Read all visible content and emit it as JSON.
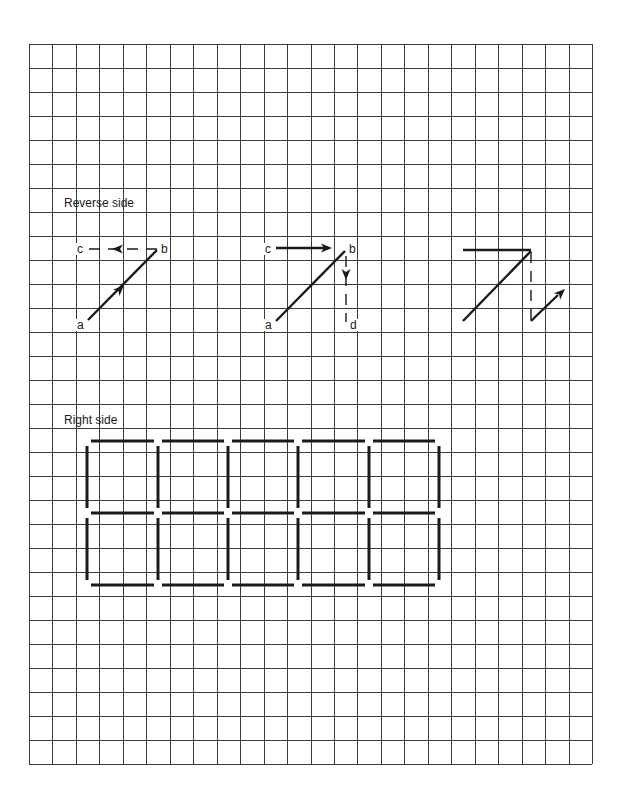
{
  "page": {
    "width": 623,
    "height": 799,
    "background": "#ffffff",
    "ink": "#1a1a1a"
  },
  "grid": {
    "x0": 29,
    "y0": 44,
    "x1": 592,
    "y1": 764,
    "columns": 24,
    "rows": 30,
    "line_color": "#3a3a3a"
  },
  "sections": {
    "reverse": {
      "label": "Reverse side",
      "label_pos": [
        64,
        207
      ]
    },
    "right": {
      "label": "Right side",
      "label_pos": [
        64,
        424
      ]
    }
  },
  "figures": [
    {
      "id": "figure-1",
      "points": {
        "a": [
          88,
          320
        ],
        "b": [
          157,
          250
        ],
        "c": [
          88,
          249
        ]
      },
      "labels": [
        {
          "text": "a",
          "x": 77,
          "y": 329
        },
        {
          "text": "b",
          "x": 161,
          "y": 253
        },
        {
          "text": "c",
          "x": 77,
          "y": 253
        }
      ],
      "solid_lines": [
        {
          "from": [
            88,
            320
          ],
          "to": [
            157,
            250
          ]
        }
      ],
      "dashed_lines": [
        {
          "from": [
            157,
            249
          ],
          "to": [
            88,
            249
          ]
        }
      ],
      "arrowheads": [
        {
          "at": [
            124,
            285
          ],
          "direction": [
            1,
            -1.01
          ]
        },
        {
          "at": [
            112,
            249
          ],
          "direction": [
            -1,
            0
          ]
        }
      ]
    },
    {
      "id": "figure-2",
      "points": {
        "a": [
          276,
          321
        ],
        "b": [
          345,
          251
        ],
        "c": [
          276,
          248
        ],
        "d": [
          346,
          322
        ]
      },
      "labels": [
        {
          "text": "a",
          "x": 265,
          "y": 329
        },
        {
          "text": "b",
          "x": 349,
          "y": 253
        },
        {
          "text": "c",
          "x": 265,
          "y": 253
        },
        {
          "text": "d",
          "x": 350,
          "y": 329
        }
      ],
      "solid_lines": [
        {
          "from": [
            276,
            321
          ],
          "to": [
            345,
            251
          ]
        },
        {
          "from": [
            276,
            248
          ],
          "to": [
            324,
            248
          ]
        }
      ],
      "dashed_lines": [
        {
          "from": [
            346,
            256
          ],
          "to": [
            346,
            322
          ]
        }
      ],
      "arrowheads": [
        {
          "at": [
            332,
            248
          ],
          "direction": [
            1,
            0
          ]
        },
        {
          "at": [
            346,
            280
          ],
          "direction": [
            0,
            1
          ]
        }
      ]
    },
    {
      "id": "figure-3",
      "points": {},
      "labels": [],
      "solid_lines": [
        {
          "from": [
            463,
            250
          ],
          "to": [
            531,
            250
          ]
        },
        {
          "from": [
            463,
            321
          ],
          "to": [
            531,
            251
          ]
        },
        {
          "from": [
            531,
            321
          ],
          "to": [
            558,
            295
          ]
        }
      ],
      "dashed_lines": [
        {
          "from": [
            531,
            252
          ],
          "to": [
            531,
            320
          ]
        }
      ],
      "arrowheads": [
        {
          "at": [
            565,
            289
          ],
          "direction": [
            1,
            -0.95
          ]
        }
      ]
    }
  ],
  "box_grid": {
    "columns": 5,
    "rows": 2,
    "x": [
      87,
      158,
      228,
      298,
      369,
      439
    ],
    "y": [
      441,
      513,
      585
    ],
    "gap": 4
  }
}
